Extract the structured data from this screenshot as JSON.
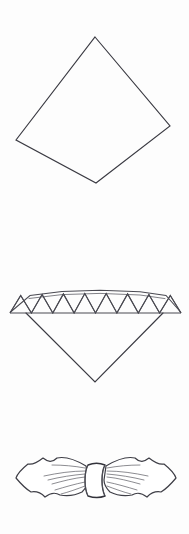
{
  "document": {
    "title": "Napkin Folding Instruction Figures",
    "background_color": "#ffffff",
    "ink_color": "#3a3a42",
    "width_px": 189,
    "height_px": 534,
    "step_count": 3
  },
  "figures": [
    {
      "id": "step-1",
      "name": "square-napkin-diamond",
      "label": "",
      "shape": "diamond",
      "description": "Open square napkin positioned as a diamond",
      "vertices": {
        "top": [
          95,
          37
        ],
        "right": [
          170,
          126
        ],
        "bottom": [
          96,
          183
        ],
        "left": [
          16,
          140
        ]
      },
      "stroke_color": "#3a3a42",
      "fill_color": "#ffffff"
    },
    {
      "id": "step-2",
      "name": "accordion-pleated-band",
      "label": "",
      "shape": "zigzag-band-with-point",
      "description": "Napkin accordion pleated into a zigzag band with a V point hanging below",
      "pleat_count": 8,
      "band_left_x": 10,
      "band_right_x": 181,
      "band_top_y": 293,
      "band_bottom_y": 313,
      "point_apex": [
        95,
        365
      ],
      "stroke_color": "#4a4a52",
      "fill_color": "#ffffff"
    },
    {
      "id": "step-3",
      "name": "bow-fan-with-ring",
      "label": "",
      "shape": "bowtie-through-ring",
      "description": "Pleated napkin drawn through a napkin ring forming a bow or fan",
      "ring_center": [
        96,
        480
      ],
      "ring_width": 20,
      "ring_height": 30,
      "left_wing_tip": [
        16,
        480
      ],
      "right_wing_tip": [
        176,
        480
      ],
      "stroke_color": "#3e3e46",
      "fill_color": "#ffffff"
    }
  ],
  "annotations": {
    "captions": [],
    "numbers": [],
    "arrows": []
  }
}
